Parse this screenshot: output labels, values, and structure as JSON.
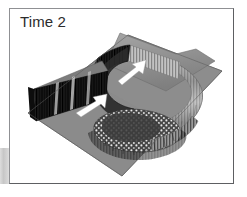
{
  "panel": {
    "caption": "Time 2",
    "frame_border_color": "#8f9093",
    "background_color": "#ffffff"
  },
  "figure": {
    "type": "3d-surface-plot",
    "base_plane": {
      "name": "ground-plane",
      "fill": "#8c8c8c",
      "edge": "#6e6e6e"
    },
    "structures": [
      {
        "name": "outer-spiral-wall",
        "shade": "#bdbdbd",
        "texture": "vertical-stripes"
      },
      {
        "name": "inner-spiral-wall",
        "shade": "#3a3a3a",
        "texture": "vertical-stripes"
      },
      {
        "name": "left-ridge-wall",
        "shade": "#2e2e2e",
        "texture": "vertical-stripes"
      },
      {
        "name": "basin-floor",
        "shade": "#4a4a4a",
        "texture": "stipple-dots"
      },
      {
        "name": "top-plateau",
        "shade": "#9a9a9a",
        "texture": "flat"
      }
    ],
    "annotations": [
      {
        "name": "arrow-upper",
        "symbol": "arrow",
        "color": "#ffffff",
        "direction": "up-right"
      },
      {
        "name": "arrow-lower",
        "symbol": "arrow",
        "color": "#ffffff",
        "direction": "up-right"
      }
    ],
    "palette": {
      "light_gray": "#c8c8c8",
      "mid_gray": "#8c8c8c",
      "dark_gray": "#3a3a3a",
      "near_black": "#1f1f1f",
      "white": "#ffffff"
    }
  }
}
